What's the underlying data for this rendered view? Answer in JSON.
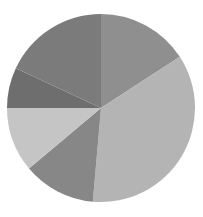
{
  "figure": {
    "background_color": "#ffffff",
    "width": 203,
    "height": 217,
    "title": "",
    "alt_text": "Grayscale pie chart with six slices"
  },
  "chart_data": {
    "type": "pie",
    "title": "",
    "subtitle": "",
    "xlabel": "",
    "ylabel": "",
    "legend": false,
    "legend_position": "none",
    "grid": false,
    "labels_shown": false,
    "value_unit": "percent",
    "start_angle_deg": 0,
    "direction": "clockwise",
    "center_x": 101,
    "center_y": 108,
    "radius": 94,
    "categories": [
      "Slice 1",
      "Slice 2",
      "Slice 3",
      "Slice 4",
      "Slice 5",
      "Slice 6"
    ],
    "values": [
      15.8,
      35.6,
      12.5,
      11.1,
      6.9,
      18.1
    ],
    "angles_deg": [
      57,
      128,
      45,
      40,
      25,
      65
    ],
    "colors": [
      "#8f8f8f",
      "#b4b4b4",
      "#878787",
      "#c5c5c5",
      "#6e6e6e",
      "#7b7b7b"
    ],
    "series": [
      {
        "name": "Series 1",
        "values": [
          15.8,
          35.6,
          12.5,
          11.1,
          6.9,
          18.1
        ]
      }
    ],
    "slices": [
      {
        "name": "Slice 1",
        "value": 15.8,
        "angle_deg": 57,
        "start_deg": 0,
        "end_deg": 57,
        "color": "#8f8f8f"
      },
      {
        "name": "Slice 2",
        "value": 35.6,
        "angle_deg": 128,
        "start_deg": 57,
        "end_deg": 185,
        "color": "#b4b4b4"
      },
      {
        "name": "Slice 3",
        "value": 12.5,
        "angle_deg": 45,
        "start_deg": 185,
        "end_deg": 230,
        "color": "#878787"
      },
      {
        "name": "Slice 4",
        "value": 11.1,
        "angle_deg": 40,
        "start_deg": 230,
        "end_deg": 270,
        "color": "#c5c5c5"
      },
      {
        "name": "Slice 5",
        "value": 6.9,
        "angle_deg": 25,
        "start_deg": 270,
        "end_deg": 295,
        "color": "#6e6e6e"
      },
      {
        "name": "Slice 6",
        "value": 18.1,
        "angle_deg": 65,
        "start_deg": 295,
        "end_deg": 360,
        "color": "#7b7b7b"
      }
    ]
  }
}
